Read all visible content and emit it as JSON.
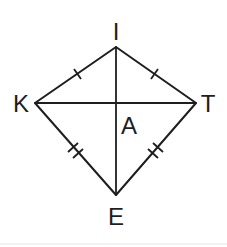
{
  "diagram": {
    "type": "kite",
    "vertices": {
      "I": {
        "label": "I",
        "x": 116,
        "y": 47
      },
      "K": {
        "label": "K",
        "x": 35,
        "y": 103
      },
      "T": {
        "label": "T",
        "x": 196,
        "y": 103
      },
      "E": {
        "label": "E",
        "x": 116,
        "y": 195
      }
    },
    "intersection": {
      "label": "A",
      "x": 116,
      "y": 103
    },
    "edges": [
      {
        "from": "K",
        "to": "I",
        "ticks": 1
      },
      {
        "from": "I",
        "to": "T",
        "ticks": 1
      },
      {
        "from": "K",
        "to": "E",
        "ticks": 2
      },
      {
        "from": "T",
        "to": "E",
        "ticks": 2
      }
    ],
    "diagonals": [
      {
        "from": "I",
        "to": "E"
      },
      {
        "from": "K",
        "to": "T"
      }
    ],
    "colors": {
      "stroke": "#1e1e1e",
      "background": "#ffffff"
    }
  }
}
